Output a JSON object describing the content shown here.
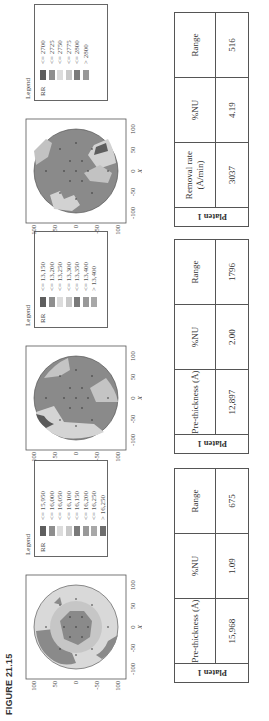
{
  "figure_label": "FIGURE 21.15",
  "axis": {
    "x_label": "X",
    "y_label": "Y",
    "x_ticks": [
      "-100",
      "-50",
      "0",
      "50",
      "100"
    ],
    "y_ticks": [
      "100",
      "50",
      "0",
      "-50",
      "-100"
    ]
  },
  "panels": [
    {
      "legend_title": "Legend",
      "legend_var": "RR",
      "legend_items": [
        {
          "label": "<= 15,950",
          "color": "#5e5e5e"
        },
        {
          "label": "<= 16,000",
          "color": "#8e8e8e"
        },
        {
          "label": "<= 16,050",
          "color": "#dcdcdc"
        },
        {
          "label": "<= 16,100",
          "color": "#c8c8c8"
        },
        {
          "label": "<= 16,150",
          "color": "#7a7a7a"
        },
        {
          "label": "<= 16,200",
          "color": "#999999"
        },
        {
          "label": "<= 16,250",
          "color": "#a8a8a8"
        },
        {
          "label": "> 16,250",
          "color": "#6e6e6e"
        }
      ],
      "table": {
        "row_label": "Platen 1",
        "headers": [
          "Pre-thickness (Å)",
          "%NU",
          "Range"
        ],
        "values": [
          "15,968",
          "1.09",
          "675"
        ]
      }
    },
    {
      "legend_title": "Legend",
      "legend_var": "RR",
      "legend_items": [
        {
          "label": "<= 13,150",
          "color": "#5e5e5e"
        },
        {
          "label": "<= 13,200",
          "color": "#8e8e8e"
        },
        {
          "label": "<= 13,250",
          "color": "#dcdcdc"
        },
        {
          "label": "<= 13,300",
          "color": "#c8c8c8"
        },
        {
          "label": "<= 13,350",
          "color": "#7a7a7a"
        },
        {
          "label": "<= 13,400",
          "color": "#999999"
        },
        {
          "label": "> 13,400",
          "color": "#a8a8a8"
        }
      ],
      "table": {
        "row_label": "Platen 1",
        "headers": [
          "Pre-thickness (Å)",
          "%NU",
          "Range"
        ],
        "values": [
          "12,897",
          "2.00",
          "1796"
        ]
      }
    },
    {
      "legend_title": "Legend",
      "legend_var": "RR",
      "legend_items": [
        {
          "label": "<= 2700",
          "color": "#5e5e5e"
        },
        {
          "label": "<= 2725",
          "color": "#8e8e8e"
        },
        {
          "label": "<= 2750",
          "color": "#dcdcdc"
        },
        {
          "label": "<= 2775",
          "color": "#c8c8c8"
        },
        {
          "label": "<= 2800",
          "color": "#7a7a7a"
        },
        {
          "label": "> 2800",
          "color": "#999999"
        }
      ],
      "table": {
        "row_label": "Platen 1",
        "headers": [
          "Removal rate (Å/min)",
          "%NU",
          "Range"
        ],
        "values": [
          "3037",
          "4.19",
          "516"
        ]
      }
    }
  ]
}
